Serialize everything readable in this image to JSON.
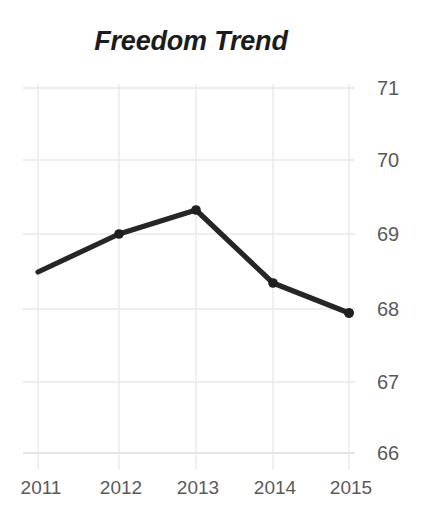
{
  "chart_data": {
    "type": "line",
    "title": "Freedom Trend",
    "xlabel": "",
    "ylabel": "",
    "categories": [
      "2011",
      "2012",
      "2013",
      "2014",
      "2015"
    ],
    "x": [
      2011,
      2012,
      2013,
      2014,
      2015
    ],
    "values": [
      68.48,
      69.0,
      69.33,
      68.33,
      67.95
    ],
    "series": [
      {
        "name": "Freedom Trend",
        "values": [
          68.48,
          69.0,
          69.33,
          68.33,
          67.95
        ]
      }
    ],
    "ylim": [
      66,
      71
    ],
    "yticks": [
      71,
      70,
      69,
      68,
      67,
      66
    ],
    "ytick_labels": [
      "71",
      "70",
      "69",
      "68",
      "67",
      "66"
    ],
    "xtick_labels": [
      "2011",
      "2012",
      "2013",
      "2014",
      "2015"
    ],
    "grid": true,
    "grid_axis": "both",
    "legend": false,
    "legend_position": "none",
    "y_axis_side": "right",
    "marker": "circle",
    "colors": {
      "line": "#262626",
      "marker": "#1f1f1f",
      "grid": "#e4e4e4",
      "axis_text": "#5a5a5a",
      "title_text": "#1c1c1c",
      "background": "#ffffff"
    }
  },
  "plot_geometry": {
    "left": 23,
    "right": 355,
    "top": 88,
    "bottom": 453,
    "x_positions": [
      38,
      119,
      196,
      273,
      349
    ],
    "y_positions": [
      272,
      234,
      210,
      283,
      313
    ],
    "ytick_y": [
      88,
      160,
      234,
      309,
      382,
      453
    ],
    "xtick_label_y": 478
  }
}
